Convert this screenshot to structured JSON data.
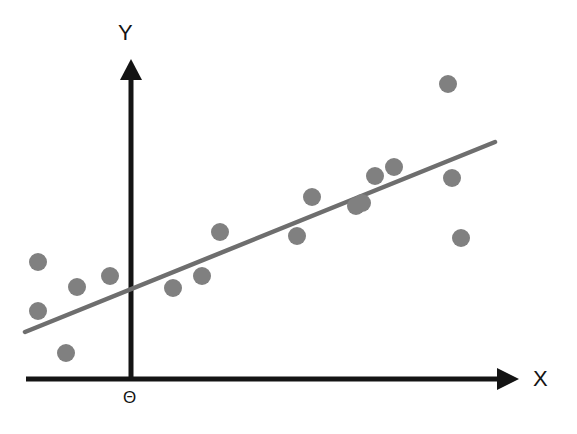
{
  "figure": {
    "width": 577,
    "height": 434,
    "background_color": "#ffffff"
  },
  "labels": {
    "y_axis": "Y",
    "x_axis": "X",
    "origin": "Θ"
  },
  "colors": {
    "axis": "#141414",
    "point_fill": "#808080",
    "regression_line": "#6e6e6e",
    "background": "#ffffff"
  },
  "chart_data": {
    "type": "scatter",
    "title": "",
    "subtitle": "",
    "xlabel": "X",
    "ylabel": "Y",
    "origin_label": "Θ",
    "grid": false,
    "legend": null,
    "axis_style": "arrow-headed cartesian axes, no tick marks, no tick labels",
    "xlim": [
      26,
      518
    ],
    "ylim": [
      60,
      379
    ],
    "point_radius": 9,
    "point_color": "#808080",
    "n_points": 19,
    "points_pixel": [
      {
        "x": 38,
        "y": 262
      },
      {
        "x": 38,
        "y": 311
      },
      {
        "x": 66,
        "y": 353
      },
      {
        "x": 77,
        "y": 287
      },
      {
        "x": 110,
        "y": 276
      },
      {
        "x": 173,
        "y": 288
      },
      {
        "x": 202,
        "y": 276
      },
      {
        "x": 220,
        "y": 232
      },
      {
        "x": 297,
        "y": 236
      },
      {
        "x": 312,
        "y": 197
      },
      {
        "x": 356,
        "y": 206
      },
      {
        "x": 362,
        "y": 203
      },
      {
        "x": 375,
        "y": 176
      },
      {
        "x": 394,
        "y": 167
      },
      {
        "x": 448,
        "y": 84
      },
      {
        "x": 452,
        "y": 178
      },
      {
        "x": 461,
        "y": 238
      }
    ],
    "points_data": [
      {
        "x": -1.0,
        "y": 1.34
      },
      {
        "x": -1.0,
        "y": 0.89
      },
      {
        "x": -0.75,
        "y": 0.5
      },
      {
        "x": -0.65,
        "y": 1.11
      },
      {
        "x": -0.23,
        "y": 1.21
      },
      {
        "x": 0.42,
        "y": 1.1
      },
      {
        "x": 0.72,
        "y": 1.21
      },
      {
        "x": 0.91,
        "y": 1.61
      },
      {
        "x": 1.71,
        "y": 1.57
      },
      {
        "x": 1.87,
        "y": 1.93
      },
      {
        "x": 2.32,
        "y": 1.85
      },
      {
        "x": 2.38,
        "y": 1.88
      },
      {
        "x": 2.52,
        "y": 2.13
      },
      {
        "x": 2.71,
        "y": 2.21
      },
      {
        "x": 3.27,
        "y": 2.98
      },
      {
        "x": 3.31,
        "y": 2.11
      },
      {
        "x": 3.4,
        "y": 1.56
      }
    ],
    "regression_line": {
      "visible": true,
      "color": "#6e6e6e",
      "width": 4,
      "x_start_pixel": 25,
      "y_start_pixel": 332,
      "x_end_pixel": 495,
      "y_end_pixel": 142,
      "slope_pixel": -0.404,
      "description": "best fit straight line with positive slope crossing the Y axis below the origin-area midpoint"
    }
  }
}
